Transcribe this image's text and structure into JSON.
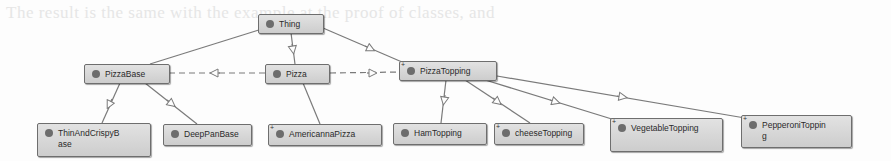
{
  "background_text": {
    "line1": "The result is the same with the example at the proof of classes, and",
    "line2": "are classes and ... in the top"
  },
  "diagram": {
    "type": "class-hierarchy",
    "colors": {
      "node_fill": "#d6d6d6",
      "node_border": "#6e6e6e",
      "dot": "#6d6d6d",
      "edge": "#7a7a7a"
    },
    "nodes": [
      {
        "id": "thing",
        "label": "Thing",
        "expandable": false
      },
      {
        "id": "pizzabase",
        "label": "PizzaBase",
        "expandable": false
      },
      {
        "id": "pizza",
        "label": "Pizza",
        "expandable": false
      },
      {
        "id": "pizzatopping",
        "label": "PizzaTopping",
        "expandable": true
      },
      {
        "id": "thinandcrispybase",
        "label": "ThinAndCrispyBase",
        "expandable": false
      },
      {
        "id": "deeppanbase",
        "label": "DeepPanBase",
        "expandable": false
      },
      {
        "id": "americannapizza",
        "label": "AmericannaPizza",
        "expandable": true
      },
      {
        "id": "hamtopping",
        "label": "HamTopping",
        "expandable": false
      },
      {
        "id": "cheesetopping",
        "label": "cheeseTopping",
        "expandable": true
      },
      {
        "id": "vegetabletopping",
        "label": "VegetableTopping",
        "expandable": true
      },
      {
        "id": "pepperonitopping",
        "label": "PepperoniTopping",
        "expandable": true
      }
    ],
    "edges": [
      {
        "from": "pizzabase",
        "to": "thing",
        "style": "solid",
        "kind": "subclass"
      },
      {
        "from": "pizza",
        "to": "thing",
        "style": "solid",
        "kind": "subclass"
      },
      {
        "from": "pizzatopping",
        "to": "thing",
        "style": "solid",
        "kind": "subclass"
      },
      {
        "from": "pizza",
        "to": "pizzabase",
        "style": "dashed",
        "kind": "property"
      },
      {
        "from": "pizza",
        "to": "pizzatopping",
        "style": "dashed",
        "kind": "property"
      },
      {
        "from": "thinandcrispybase",
        "to": "pizzabase",
        "style": "solid",
        "kind": "subclass"
      },
      {
        "from": "deeppanbase",
        "to": "pizzabase",
        "style": "solid",
        "kind": "subclass"
      },
      {
        "from": "americannapizza",
        "to": "pizza",
        "style": "solid",
        "kind": "subclass"
      },
      {
        "from": "hamtopping",
        "to": "pizzatopping",
        "style": "solid",
        "kind": "subclass"
      },
      {
        "from": "cheesetopping",
        "to": "pizzatopping",
        "style": "solid",
        "kind": "subclass"
      },
      {
        "from": "vegetabletopping",
        "to": "pizzatopping",
        "style": "solid",
        "kind": "subclass"
      },
      {
        "from": "pepperonitopping",
        "to": "pizzatopping",
        "style": "solid",
        "kind": "subclass"
      }
    ]
  }
}
